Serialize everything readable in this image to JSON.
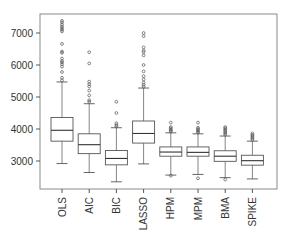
{
  "chart_data": {
    "type": "box",
    "title": "",
    "xlabel": "",
    "ylabel": "",
    "ylim": [
      2150,
      7650
    ],
    "yticks": [
      3000,
      4000,
      5000,
      6000,
      7000
    ],
    "ytick_labels": [
      "3000",
      "4000",
      "5000",
      "6000",
      "7000"
    ],
    "grid": false,
    "legend": null,
    "x_tick_label_rotation": 90,
    "categories": [
      "OLS",
      "AIC",
      "BIC",
      "LASSO",
      "HPM",
      "MPM",
      "BMA",
      "SPIKE"
    ],
    "series": [
      {
        "name": "OLS",
        "whisker_low": 2920,
        "q1": 3620,
        "median": 3960,
        "q3": 4360,
        "whisker_high": 5470,
        "outliers": [
          5520,
          5600,
          5780,
          5950,
          6020,
          6080,
          6120,
          6200,
          6380,
          6420,
          6660,
          7050,
          7100,
          7150,
          7200,
          7260,
          7330,
          7380
        ]
      },
      {
        "name": "AIC",
        "whisker_low": 2640,
        "q1": 3230,
        "median": 3510,
        "q3": 3850,
        "whisker_high": 4790,
        "outliers": [
          4850,
          4900,
          5050,
          5200,
          5330,
          5400,
          5480,
          6050,
          6400
        ]
      },
      {
        "name": "BIC",
        "whisker_low": 2350,
        "q1": 2880,
        "median": 3080,
        "q3": 3330,
        "whisker_high": 4040,
        "outliers": [
          4080,
          4120,
          4180,
          4500,
          4850
        ]
      },
      {
        "name": "LASSO",
        "whisker_low": 2910,
        "q1": 3560,
        "median": 3860,
        "q3": 4250,
        "whisker_high": 5280,
        "outliers": [
          5320,
          5380,
          5450,
          5550,
          5650,
          5800,
          6000,
          6300,
          6400,
          6450,
          6550,
          6900,
          7000
        ]
      },
      {
        "name": "HPM",
        "whisker_low": 2560,
        "q1": 3150,
        "median": 3280,
        "q3": 3440,
        "whisker_high": 3880,
        "outliers": [
          2540,
          3920,
          3950,
          3980,
          4020,
          4060,
          4200
        ]
      },
      {
        "name": "MPM",
        "whisker_low": 2580,
        "q1": 3150,
        "median": 3270,
        "q3": 3440,
        "whisker_high": 3850,
        "outliers": [
          2460,
          3890,
          3920,
          3960,
          4000,
          4040,
          4200
        ]
      },
      {
        "name": "BMA",
        "whisker_low": 2480,
        "q1": 2990,
        "median": 3150,
        "q3": 3320,
        "whisker_high": 3780,
        "outliers": [
          2420,
          3820,
          3860,
          3900,
          3940,
          3980,
          4020,
          4060
        ]
      },
      {
        "name": "SPIKE",
        "whisker_low": 2440,
        "q1": 2870,
        "median": 3010,
        "q3": 3180,
        "whisker_high": 3620,
        "outliers": [
          3660,
          3700,
          3740,
          3780,
          3820,
          3860
        ]
      }
    ]
  }
}
